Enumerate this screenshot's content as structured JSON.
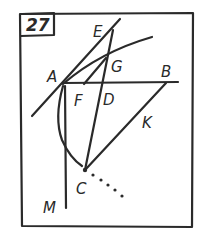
{
  "figure": {
    "number": "27",
    "labels": {
      "A": "A",
      "B": "B",
      "C": "C",
      "D": "D",
      "E": "E",
      "F": "F",
      "G": "G",
      "K": "K",
      "M": "M"
    },
    "ink_color": "#2a2a2a",
    "background_color": "#ffffff"
  }
}
